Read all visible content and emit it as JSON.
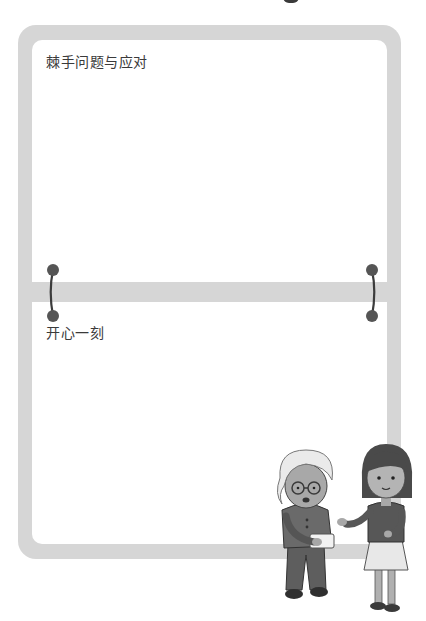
{
  "sections": [
    {
      "title": "棘手问题与应对"
    },
    {
      "title": "开心一刻"
    }
  ],
  "colors": {
    "frame": "#d6d6d6",
    "panel": "#ffffff",
    "text": "#3a3a3a",
    "connector": "#555555"
  },
  "illustration": {
    "description": "elderly woman with glasses holding a small box, and a girl gesturing toward her"
  }
}
